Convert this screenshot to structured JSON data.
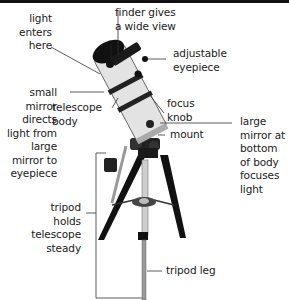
{
  "diagram": {
    "labels": {
      "light_enters": "light\nenters\nhere",
      "finder": "finder gives\na wide view",
      "eyepiece": "adjustable\neyepiece",
      "small_mirror": "small\nmirror\ndirects\nlight from\nlarge\nmirror to\neyepiece",
      "telescope_body": "telescope\nbody",
      "focus_knob": "focus\nknob",
      "large_mirror": "large\nmirror at\nbottom\nof body\nfocuses\nlight",
      "mount": "mount",
      "tripod": "tripod\nholds\ntelescope\nsteady",
      "tripod_leg": "tripod leg"
    },
    "colors": {
      "ink": "#1a1a1a",
      "tube": "#d9d9d9",
      "dark": "#111111",
      "leader": "#333333"
    }
  }
}
